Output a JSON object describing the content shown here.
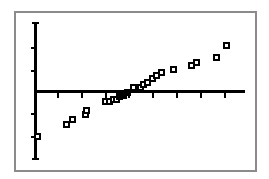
{
  "screen": {
    "width": 269,
    "height": 179,
    "background_color": "#ffffff",
    "frame_color": "#8b8b8b",
    "ink_color": "#000000",
    "device_label": "graphing-calculator-screen"
  },
  "chart_data": {
    "type": "scatter",
    "title": "",
    "subtitle": "",
    "xlabel": "",
    "ylabel": "",
    "grid": false,
    "legend": null,
    "marker": "open-square",
    "axis": {
      "x_axis_y_pixel": 90,
      "y_axis_x_pixel": 34,
      "x_axis_start_pixel": 34,
      "x_axis_end_pixel": 245,
      "y_axis_top_pixel": 22,
      "y_axis_bottom_pixel": 160,
      "x_tick_pixels": [
        57,
        81,
        105,
        128,
        152,
        176,
        200,
        224
      ],
      "y_tick_pixels": [
        47,
        70,
        113,
        136
      ],
      "x_tick_labels": [],
      "y_tick_labels": [],
      "xlim": [
        -4.5,
        4.5
      ],
      "ylim": [
        -3.0,
        3.0
      ]
    },
    "x": [
      -3.7,
      -2.5,
      -2.1,
      -1.6,
      -1.5,
      -0.9,
      -0.75,
      -0.6,
      -0.5,
      -0.42,
      -0.3,
      -0.1,
      0.15,
      0.3,
      0.45,
      0.6,
      0.8,
      1.0,
      1.25,
      1.5,
      2.1,
      2.35,
      3.3,
      3.7
    ],
    "y": [
      -2.0,
      -1.1,
      -0.95,
      -0.75,
      -0.72,
      -0.35,
      -0.34,
      -0.3,
      -0.28,
      -0.2,
      -0.12,
      -0.05,
      0.05,
      0.08,
      0.12,
      0.28,
      0.42,
      0.5,
      0.62,
      0.78,
      0.92,
      1.0,
      1.25,
      1.55
    ],
    "points_pixels": [
      {
        "cx": 37,
        "cy": 136,
        "filled": false
      },
      {
        "cx": 66,
        "cy": 124,
        "filled": false
      },
      {
        "cx": 72,
        "cy": 119,
        "filled": false
      },
      {
        "cx": 85,
        "cy": 114,
        "filled": false
      },
      {
        "cx": 86,
        "cy": 110,
        "filled": false
      },
      {
        "cx": 105,
        "cy": 101,
        "filled": false
      },
      {
        "cx": 109,
        "cy": 101,
        "filled": false
      },
      {
        "cx": 113,
        "cy": 99,
        "filled": false
      },
      {
        "cx": 116,
        "cy": 99,
        "filled": false
      },
      {
        "cx": 119,
        "cy": 96,
        "filled": true
      },
      {
        "cx": 123,
        "cy": 95,
        "filled": true
      },
      {
        "cx": 127,
        "cy": 92,
        "filled": true
      },
      {
        "cx": 133,
        "cy": 87,
        "filled": false
      },
      {
        "cx": 140,
        "cy": 87,
        "filled": false
      },
      {
        "cx": 143,
        "cy": 84,
        "filled": false
      },
      {
        "cx": 147,
        "cy": 82,
        "filled": false
      },
      {
        "cx": 152,
        "cy": 78,
        "filled": false
      },
      {
        "cx": 156,
        "cy": 75,
        "filled": false
      },
      {
        "cx": 161,
        "cy": 72,
        "filled": false
      },
      {
        "cx": 173,
        "cy": 69,
        "filled": false
      },
      {
        "cx": 191,
        "cy": 65,
        "filled": false
      },
      {
        "cx": 196,
        "cy": 62,
        "filled": false
      },
      {
        "cx": 216,
        "cy": 57,
        "filled": false
      },
      {
        "cx": 226,
        "cy": 45,
        "filled": false
      }
    ],
    "point_count": 24
  }
}
